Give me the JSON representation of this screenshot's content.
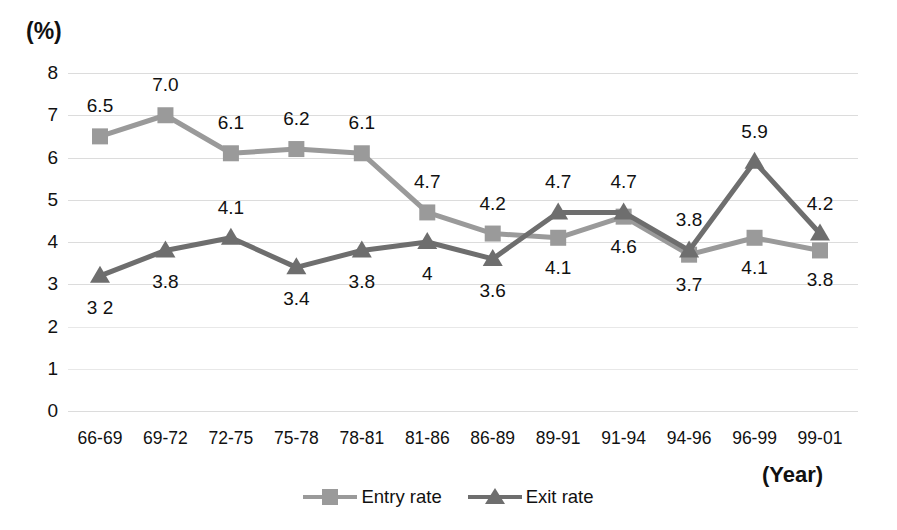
{
  "chart_data": {
    "type": "line",
    "title": "",
    "xlabel": "(Year)",
    "ylabel": "(%)",
    "ylim": [
      0,
      8
    ],
    "yticks": [
      "0",
      "1",
      "2",
      "3",
      "4",
      "5",
      "6",
      "7",
      "8"
    ],
    "grid": true,
    "legend_position": "bottom-center",
    "categories": [
      "66-69",
      "69-72",
      "72-75",
      "75-78",
      "78-81",
      "81-86",
      "86-89",
      "89-91",
      "91-94",
      "94-96",
      "96-99",
      "99-01"
    ],
    "series": [
      {
        "name": "Entry rate",
        "marker": "square",
        "color": "#9a9a9a",
        "values": [
          6.5,
          7.0,
          6.1,
          6.2,
          6.1,
          4.7,
          4.2,
          4.1,
          4.6,
          3.7,
          4.1,
          3.8
        ],
        "point_labels": [
          "6.5",
          "7.0",
          "6.1",
          "6.2",
          "6.1",
          "4.7",
          "4.2",
          "4.1",
          "4.6",
          "3.7",
          "4.1",
          "3.8"
        ],
        "label_offsets_y": [
          -30,
          -30,
          -30,
          -30,
          -30,
          -30,
          -30,
          30,
          30,
          30,
          30,
          30
        ]
      },
      {
        "name": "Exit rate",
        "marker": "triangle",
        "color": "#6e6e6e",
        "values": [
          3.2,
          3.8,
          4.1,
          3.4,
          3.8,
          4.0,
          3.6,
          4.7,
          4.7,
          3.8,
          5.9,
          4.2
        ],
        "point_labels": [
          "3 2",
          "3.8",
          "4.1",
          "3.4",
          "3.8",
          "4",
          "3.6",
          "4.7",
          "4.7",
          "3.8",
          "5.9",
          "4.2"
        ],
        "label_offsets_y": [
          32,
          32,
          -30,
          32,
          32,
          32,
          32,
          -30,
          -30,
          -30,
          -30,
          -30
        ]
      }
    ]
  },
  "axis": {
    "y_unit_label": "(%)",
    "x_unit_label": "(Year)"
  },
  "legend": {
    "items": [
      {
        "label": "Entry rate",
        "marker": "square-marker",
        "color": "#9a9a9a"
      },
      {
        "label": "Exit rate",
        "marker": "triangle-marker",
        "color": "#6e6e6e"
      }
    ]
  },
  "colors": {
    "entry": "#9a9a9a",
    "exit": "#6e6e6e",
    "grid": "#dcdcdc",
    "text": "#111111",
    "background": "#ffffff"
  }
}
